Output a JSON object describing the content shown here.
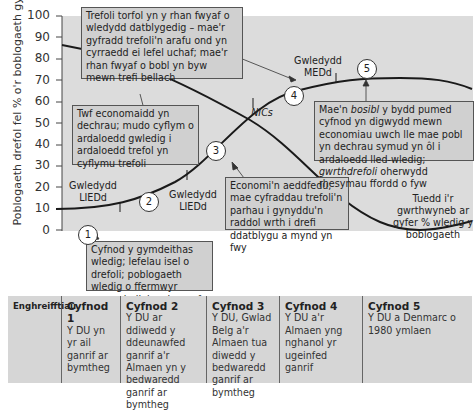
{
  "chart": {
    "y_axis_label": "Poblogaeth drefol fel % o'r boblogaeth gyfan",
    "y_ticks": [
      "100",
      "90",
      "80",
      "70",
      "60",
      "50",
      "40",
      "30",
      "20",
      "10",
      "0"
    ]
  },
  "annotations": {
    "box_top": "Trefoli torfol yn y rhan fwyaf o wledydd datblygedig – mae'r gyfradd trefoli'n arafu ond yn cyrraedd ei lefel uchaf; mae'r rhan fwyaf o bobl yn byw mewn trefi bellach",
    "box_stage2": "Twf economaidd yn dechrau; mudo cyflym o ardaloedd gwledig i ardaloedd trefol yn cyflymu trefoli",
    "box_stage1": "Cyfnod y gymdeithas wledig; lefelau isel o drefoli; poblogaeth wledig o ffermwyr ymgynhaliol yn bennaf",
    "box_stage3": "Economi'n aeddfedu; mae cyfraddau trefoli'n parhau i gynyddu'n raddol wrth i drefi ddatblygu a mynd yn fwy",
    "box_stage5_part1": "Mae'n ",
    "box_stage5_italic1": "bosibl",
    "box_stage5_part2": " y bydd pumed cyfnod yn digwydd mewn economiau uwch lle mae pobl yn dechrau symud yn ôl i ardaloedd lled-wledig; ",
    "box_stage5_italic2": "gwrthdrefoli",
    "box_stage5_part3": " oherwydd rhesymau ffordd o fyw",
    "rural_trend": "Tuedd i'r gwrthwyneb ar gyfer % wledig y boblogaeth",
    "label_ledc_1": "Gwledydd LIEDd",
    "label_ledc_2": "Gwledydd LIEDd",
    "label_medc": "Gwledydd MEDd",
    "label_nics": "NICs"
  },
  "stage_markers": [
    "1",
    "2",
    "3",
    "4",
    "5"
  ],
  "examples_table": {
    "row_header": "Enghreifftiau",
    "columns": [
      {
        "title": "Cyfnod 1",
        "text": "Y DU yn yr ail ganrif ar bymtheg"
      },
      {
        "title": "Cyfnod 2",
        "text": "Y DU ar ddiwedd y ddeunawfed ganrif a'r Almaen yn y bedwaredd ganrif ar bymtheg"
      },
      {
        "title": "Cyfnod 3",
        "text": "Y DU, Gwlad Belg a'r Almaen tua diwedd y bedwaredd ganrif ar bymtheg"
      },
      {
        "title": "Cyfnod 4",
        "text": "Y DU a'r Almaen yng nghanol yr ugeinfed ganrif"
      },
      {
        "title": "Cyfnod 5",
        "text": "Y DU a Denmarc o 1980 ymlaen"
      }
    ]
  },
  "colors": {
    "plot_bg": "#dcdcdc",
    "box_bg": "#d0d0d0",
    "line": "#1a1a1a"
  }
}
